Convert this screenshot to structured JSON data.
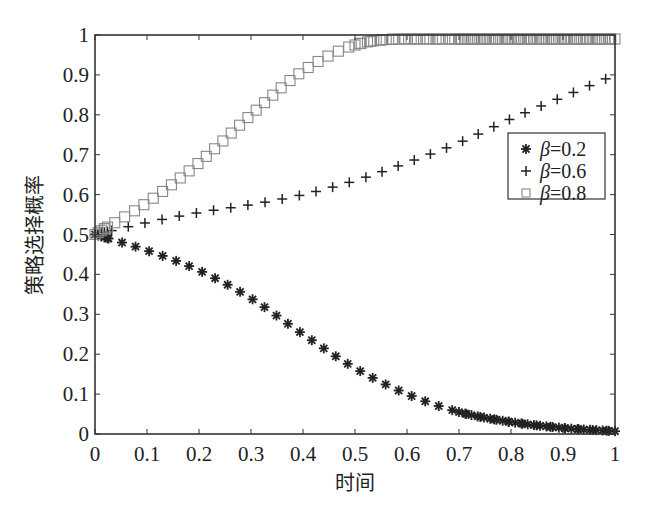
{
  "chart_data": {
    "type": "scatter",
    "title": "",
    "xlabel": "时间",
    "ylabel": "策略选择概率",
    "xlim": [
      0,
      1
    ],
    "ylim": [
      0,
      1
    ],
    "xticks": [
      "0",
      "0.1",
      "0.2",
      "0.3",
      "0.4",
      "0.5",
      "0.6",
      "0.7",
      "0.8",
      "0.9",
      "1"
    ],
    "yticks": [
      "0",
      "0.1",
      "0.2",
      "0.3",
      "0.4",
      "0.5",
      "0.6",
      "0.7",
      "0.8",
      "0.9",
      "1"
    ],
    "grid": false,
    "legend_position": "right-middle",
    "series": [
      {
        "name": "β=0.2",
        "marker": "asterisk",
        "color": "#222222",
        "x": [
          0,
          0.1,
          0.2,
          0.3,
          0.4,
          0.5,
          0.6,
          0.7,
          0.8,
          0.9,
          1.0
        ],
        "values": [
          0.5,
          0.46,
          0.41,
          0.34,
          0.25,
          0.165,
          0.1,
          0.055,
          0.03,
          0.015,
          0.007
        ]
      },
      {
        "name": "β=0.6",
        "marker": "plus",
        "color": "#222222",
        "x": [
          0,
          0.1,
          0.2,
          0.3,
          0.4,
          0.5,
          0.6,
          0.7,
          0.8,
          0.9,
          1.0
        ],
        "values": [
          0.5,
          0.53,
          0.555,
          0.575,
          0.6,
          0.635,
          0.68,
          0.73,
          0.79,
          0.845,
          0.9
        ]
      },
      {
        "name": "β=0.8",
        "marker": "square",
        "color": "#888888",
        "x": [
          0,
          0.1,
          0.2,
          0.3,
          0.4,
          0.5,
          0.6,
          0.7,
          0.8,
          0.9,
          1.0
        ],
        "values": [
          0.5,
          0.58,
          0.68,
          0.8,
          0.91,
          0.975,
          0.99,
          0.99,
          0.99,
          0.99,
          0.99
        ]
      }
    ]
  },
  "legend": {
    "items": [
      {
        "label": "β=0.2",
        "marker": "asterisk"
      },
      {
        "label": "β=0.6",
        "marker": "plus"
      },
      {
        "label": "β=0.8",
        "marker": "square"
      }
    ]
  }
}
